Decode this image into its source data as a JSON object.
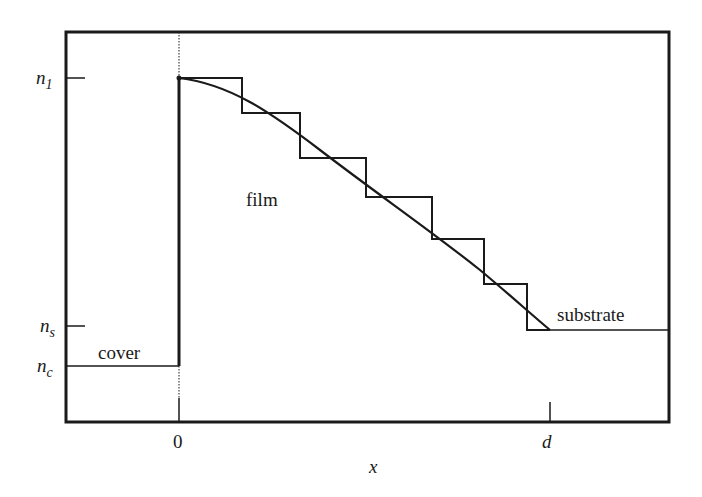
{
  "diagram": {
    "regions": {
      "cover": "cover",
      "film": "film",
      "substrate": "substrate"
    },
    "y_labels": {
      "n1": {
        "base": "n",
        "sub": "1"
      },
      "ns": {
        "base": "n",
        "sub": "s"
      },
      "nc": {
        "base": "n",
        "sub": "c"
      }
    },
    "x_labels": {
      "zero": "0",
      "d": "d",
      "axis": "x"
    },
    "colors": {
      "line": "#1a1a1a",
      "background": "#ffffff"
    },
    "step_count": 6
  }
}
